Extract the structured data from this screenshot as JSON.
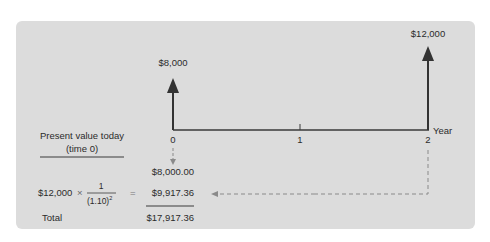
{
  "diagram": {
    "cash_flows": [
      {
        "year": 0,
        "amount_label": "$8,000"
      },
      {
        "year": 2,
        "amount_label": "$12,000"
      }
    ],
    "axis": {
      "ticks": [
        "0",
        "1",
        "2"
      ],
      "unit_label": "Year"
    },
    "left_heading": {
      "line1": "Present value today",
      "line2": "(time 0)"
    },
    "calculation": {
      "pv_year0": "$8,000.00",
      "formula_amount": "$12,000",
      "formula_times": "×",
      "fraction_numerator": "1",
      "fraction_denominator_base": "(1.10)",
      "fraction_exponent": "2",
      "equals": "=",
      "pv_year2": "$9,917.36",
      "total_label": "Total",
      "total_value": "$17,917.36"
    },
    "colors": {
      "panel": "#dcdcdc",
      "arrow": "#333333",
      "dashed": "#8a8a8a"
    }
  }
}
